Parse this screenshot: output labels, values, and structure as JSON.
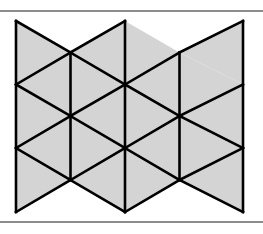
{
  "figure": {
    "title": "Triangular tessellation",
    "width": 263,
    "height": 234,
    "background_color": "#ffffff",
    "rules": {
      "color": "#8c8c8c",
      "thickness": 2,
      "top_y": 10,
      "bottom_y": 221
    }
  },
  "chart_data": {
    "type": "diagram",
    "subtype": "triangular-tiling",
    "title": "Triangular tessellation",
    "fill_color": "#d4d4d4",
    "stroke_color": "#000000",
    "stroke_width": 2.6,
    "grid": {
      "columns_x": [
        16,
        70.5,
        125,
        179.5,
        243
      ],
      "rows_even_y": [
        21,
        84.5,
        148,
        212
      ],
      "rows_odd_y": [
        52.5,
        116,
        180
      ],
      "column_spacing": 54.5,
      "row_spacing": 63.5,
      "half_row_spacing": 31.75
    },
    "vertices": [
      {
        "id": "a0",
        "x": 16,
        "y": 21
      },
      {
        "id": "a1",
        "x": 16,
        "y": 84.5
      },
      {
        "id": "a2",
        "x": 16,
        "y": 148
      },
      {
        "id": "a3",
        "x": 16,
        "y": 212
      },
      {
        "id": "b0",
        "x": 70.5,
        "y": 52.5
      },
      {
        "id": "b1",
        "x": 70.5,
        "y": 116
      },
      {
        "id": "b2",
        "x": 70.5,
        "y": 180
      },
      {
        "id": "c0",
        "x": 125,
        "y": 21
      },
      {
        "id": "c1",
        "x": 125,
        "y": 84.5
      },
      {
        "id": "c2",
        "x": 125,
        "y": 148
      },
      {
        "id": "c3",
        "x": 125,
        "y": 212
      },
      {
        "id": "d0",
        "x": 179.5,
        "y": 52.5
      },
      {
        "id": "d1",
        "x": 179.5,
        "y": 116
      },
      {
        "id": "d2",
        "x": 179.5,
        "y": 180
      },
      {
        "id": "e0",
        "x": 243,
        "y": 21
      },
      {
        "id": "e1",
        "x": 243,
        "y": 84.5
      },
      {
        "id": "e2",
        "x": 243,
        "y": 148
      },
      {
        "id": "e3",
        "x": 243,
        "y": 212
      }
    ],
    "triangles": [
      {
        "id": "t01",
        "points": "16,21 70.5,52.5 16,84.5",
        "orientation": "right"
      },
      {
        "id": "t02",
        "points": "16,84.5 70.5,52.5 70.5,116",
        "orientation": "left"
      },
      {
        "id": "t03",
        "points": "16,84.5 70.5,116 16,148",
        "orientation": "right"
      },
      {
        "id": "t04",
        "points": "16,148 70.5,116 70.5,180",
        "orientation": "left"
      },
      {
        "id": "t05",
        "points": "16,148 70.5,180 16,212",
        "orientation": "right"
      },
      {
        "id": "t06",
        "points": "70.5,52.5 125,21 125,84.5",
        "orientation": "left"
      },
      {
        "id": "t07",
        "points": "70.5,52.5 125,84.5 70.5,116",
        "orientation": "right"
      },
      {
        "id": "t08",
        "points": "70.5,116 125,84.5 125,148",
        "orientation": "left"
      },
      {
        "id": "t09",
        "points": "70.5,116 125,148 70.5,180",
        "orientation": "right"
      },
      {
        "id": "t10",
        "points": "70.5,180 125,148 125,212",
        "orientation": "left"
      },
      {
        "id": "t11",
        "points": "125,21 179.5,52.5 125,84.5",
        "orientation": "right"
      },
      {
        "id": "t12",
        "points": "125,84.5 179.5,52.5 179.5,116",
        "orientation": "left"
      },
      {
        "id": "t13",
        "points": "125,84.5 179.5,116 125,148",
        "orientation": "right"
      },
      {
        "id": "t14",
        "points": "125,148 179.5,116 179.5,180",
        "orientation": "left"
      },
      {
        "id": "t15",
        "points": "125,148 179.5,180 125,212",
        "orientation": "right"
      },
      {
        "id": "t16",
        "points": "179.5,52.5 243,21 243,84.5",
        "orientation": "left"
      },
      {
        "id": "t17",
        "points": "179.5,52.5 243,84.5 179.5,116",
        "orientation": "right"
      },
      {
        "id": "t18",
        "points": "179.5,116 243,84.5 243,148",
        "orientation": "left"
      },
      {
        "id": "t19",
        "points": "179.5,116 243,148 179.5,180",
        "orientation": "right"
      },
      {
        "id": "t20",
        "points": "179.5,180 243,148 243,212",
        "orientation": "left"
      }
    ],
    "edges": [
      {
        "id": "v-left",
        "x1": 16,
        "y1": 21,
        "x2": 16,
        "y2": 212
      },
      {
        "id": "v-col2",
        "x1": 70.5,
        "y1": 52.5,
        "x2": 70.5,
        "y2": 180
      },
      {
        "id": "v-col3",
        "x1": 125,
        "y1": 21,
        "x2": 125,
        "y2": 212
      },
      {
        "id": "v-col4",
        "x1": 179.5,
        "y1": 52.5,
        "x2": 179.5,
        "y2": 180
      },
      {
        "id": "v-right",
        "x1": 243,
        "y1": 21,
        "x2": 243,
        "y2": 212
      },
      {
        "id": "dn-1",
        "x1": 16,
        "y1": 21,
        "x2": 70.5,
        "y2": 52.5
      },
      {
        "id": "dn-2",
        "x1": 70.5,
        "y1": 52.5,
        "x2": 125,
        "y2": 84.5
      },
      {
        "id": "dn-3",
        "x1": 125,
        "y1": 84.5,
        "x2": 179.5,
        "y2": 116
      },
      {
        "id": "dn-4",
        "x1": 179.5,
        "y1": 116,
        "x2": 243,
        "y2": 148
      },
      {
        "id": "dn-5",
        "x1": 16,
        "y1": 84.5,
        "x2": 70.5,
        "y2": 116
      },
      {
        "id": "dn-6",
        "x1": 70.5,
        "y1": 116,
        "x2": 125,
        "y2": 148
      },
      {
        "id": "dn-7",
        "x1": 125,
        "y1": 148,
        "x2": 179.5,
        "y2": 180
      },
      {
        "id": "dn-8",
        "x1": 179.5,
        "y1": 180,
        "x2": 243,
        "y2": 212
      },
      {
        "id": "dn-9",
        "x1": 16,
        "y1": 148,
        "x2": 70.5,
        "y2": 180
      },
      {
        "id": "up-1",
        "x1": 16,
        "y1": 84.5,
        "x2": 70.5,
        "y2": 52.5
      },
      {
        "id": "up-2",
        "x1": 70.5,
        "y1": 52.5,
        "x2": 125,
        "y2": 21
      },
      {
        "id": "up-3",
        "x1": 125,
        "y1": 84.5,
        "x2": 179.5,
        "y2": 52.5
      },
      {
        "id": "up-4",
        "x1": 179.5,
        "y1": 52.5,
        "x2": 243,
        "y2": 21
      },
      {
        "id": "up-5",
        "x1": 16,
        "y1": 148,
        "x2": 70.5,
        "y2": 116
      },
      {
        "id": "up-6",
        "x1": 70.5,
        "y1": 116,
        "x2": 125,
        "y2": 84.5
      },
      {
        "id": "up-7",
        "x1": 125,
        "y1": 148,
        "x2": 179.5,
        "y2": 116
      },
      {
        "id": "up-8",
        "x1": 179.5,
        "y1": 116,
        "x2": 243,
        "y2": 84.5
      },
      {
        "id": "up-9",
        "x1": 16,
        "y1": 212,
        "x2": 70.5,
        "y2": 180
      },
      {
        "id": "up-10",
        "x1": 70.5,
        "y1": 180,
        "x2": 125,
        "y2": 148
      },
      {
        "id": "up-11",
        "x1": 125,
        "y1": 212,
        "x2": 179.5,
        "y2": 180
      },
      {
        "id": "up-12",
        "x1": 179.5,
        "y1": 180,
        "x2": 243,
        "y2": 148
      },
      {
        "id": "dn-10",
        "x1": 70.5,
        "y1": 180,
        "x2": 125,
        "y2": 212
      }
    ]
  }
}
